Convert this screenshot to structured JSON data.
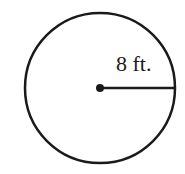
{
  "diagram": {
    "type": "circle",
    "radius_label": "8 ft.",
    "shape": {
      "center": [
        100,
        88
      ],
      "radius": 75,
      "stroke_color": "#1a1a1a",
      "stroke_width": 2.5
    },
    "radius_segment": {
      "from": [
        100,
        88
      ],
      "to": [
        175,
        88
      ]
    },
    "center_point": {
      "r": 4
    }
  }
}
